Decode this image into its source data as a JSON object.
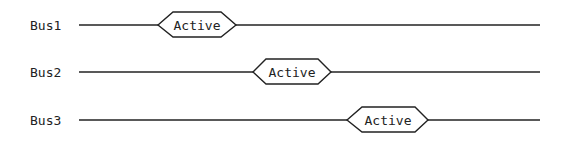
{
  "diagram": {
    "type": "bus timing diagram",
    "colors": {
      "line": "#222222",
      "background": "#ffffff"
    },
    "buses": [
      {
        "label": "Bus1",
        "state": "Active",
        "y": 25,
        "hex": {
          "left": 158,
          "top_l": 173,
          "top_r": 221,
          "right": 236
        }
      },
      {
        "label": "Bus2",
        "state": "Active",
        "y": 72,
        "hex": {
          "left": 253,
          "top_l": 266,
          "top_r": 318,
          "right": 331
        }
      },
      {
        "label": "Bus3",
        "state": "Active",
        "y": 120,
        "hex": {
          "left": 347,
          "top_l": 362,
          "top_r": 415,
          "right": 428
        }
      }
    ]
  }
}
